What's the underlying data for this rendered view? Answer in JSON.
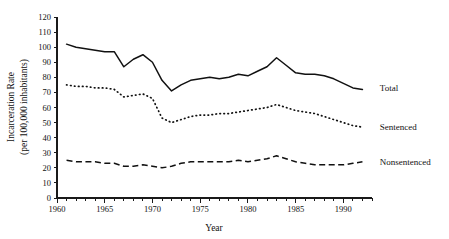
{
  "chart_data": {
    "type": "line",
    "title": "",
    "xlabel": "Year",
    "ylabel": "Incarceration Rate (per 100,000 inhabitants)",
    "ylabel_line1": "Incarceration Rate",
    "ylabel_line2": "(per 100,000 inhabitants)",
    "xlim": [
      1960,
      1993
    ],
    "ylim": [
      0,
      120
    ],
    "grid": false,
    "legend_position": "right-inline",
    "x_ticks": [
      1960,
      1965,
      1970,
      1975,
      1980,
      1985,
      1990
    ],
    "x_tick_labels": [
      "1960",
      "1965",
      "1970",
      "1975",
      "1980",
      "1985",
      "1990"
    ],
    "x_minor_tick_interval": 1,
    "y_ticks": [
      0,
      10,
      20,
      30,
      40,
      50,
      60,
      70,
      80,
      90,
      100,
      110,
      120
    ],
    "y_tick_labels": [
      "0",
      "10",
      "20",
      "30",
      "40",
      "50",
      "60",
      "70",
      "80",
      "90",
      "100",
      "110",
      "120"
    ],
    "x": [
      1961,
      1962,
      1963,
      1964,
      1965,
      1966,
      1967,
      1968,
      1969,
      1970,
      1971,
      1972,
      1973,
      1974,
      1975,
      1976,
      1977,
      1978,
      1979,
      1980,
      1981,
      1982,
      1983,
      1984,
      1985,
      1986,
      1987,
      1988,
      1989,
      1990,
      1991,
      1992
    ],
    "series": [
      {
        "name": "Total",
        "style": "solid",
        "values": [
          102,
          100,
          99,
          98,
          97,
          97,
          87,
          92,
          95,
          90,
          78,
          71,
          75,
          78,
          79,
          80,
          79,
          80,
          82,
          81,
          84,
          87,
          93,
          88,
          83,
          82,
          82,
          81,
          79,
          76,
          73,
          72
        ]
      },
      {
        "name": "Sentenced",
        "style": "dotted",
        "values": [
          75,
          74,
          74,
          73,
          73,
          72,
          67,
          68,
          69,
          66,
          53,
          50,
          52,
          54,
          55,
          55,
          56,
          56,
          57,
          58,
          59,
          60,
          62,
          60,
          58,
          57,
          56,
          54,
          52,
          50,
          48,
          47
        ]
      },
      {
        "name": "Nonsentenced",
        "style": "dashed",
        "values": [
          25,
          24,
          24,
          24,
          23,
          23,
          21,
          21,
          22,
          21,
          20,
          21,
          23,
          24,
          24,
          24,
          24,
          24,
          25,
          24,
          25,
          26,
          28,
          26,
          24,
          23,
          22,
          22,
          22,
          22,
          23,
          24
        ]
      }
    ],
    "series_label_positions": [
      {
        "name": "Total",
        "x": 1993.4,
        "y": 73
      },
      {
        "name": "Sentenced",
        "x": 1993.4,
        "y": 47
      },
      {
        "name": "Nonsentenced",
        "x": 1993.4,
        "y": 24
      }
    ]
  },
  "colors": {
    "ink": "#111111",
    "background": "#ffffff"
  }
}
